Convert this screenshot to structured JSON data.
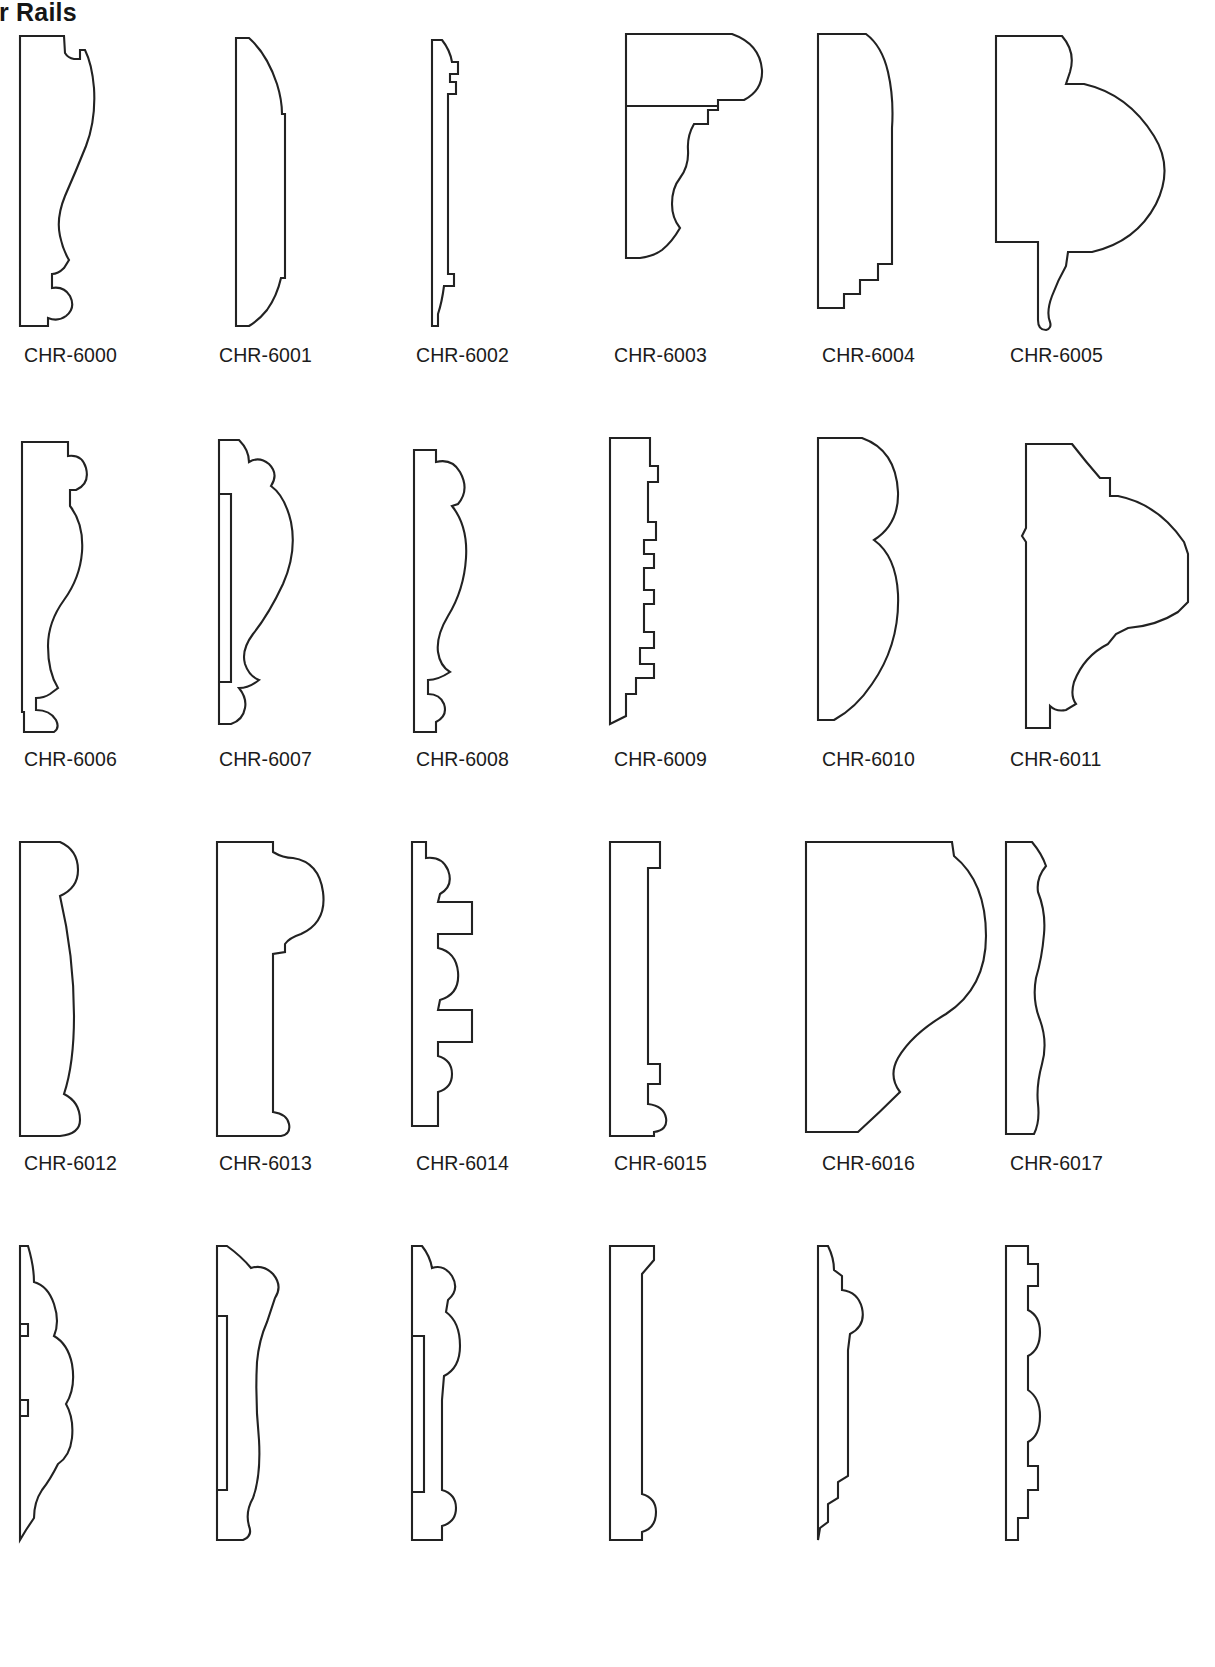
{
  "page": {
    "title": "Chair Rails",
    "title_visible_fragment": "ir Rails",
    "background_color": "#ffffff",
    "line_color": "#222222",
    "text_color": "#1b1b1b",
    "columns": 6,
    "rows_visible": 4,
    "note": "Molding profile cross-section catalog page; right column and bottom row are cropped by the page edge."
  },
  "rows": [
    {
      "index": 0,
      "items": [
        {
          "code": "CHR-6000",
          "shape": "ogee chair rail with stepped back, bead at base"
        },
        {
          "code": "CHR-6001",
          "shape": "bullnose top, flat face, cove bottom"
        },
        {
          "code": "CHR-6002",
          "shape": "narrow stepped profile with small beads"
        },
        {
          "code": "CHR-6003",
          "shape": "large quarter-round top over ogee and step"
        },
        {
          "code": "CHR-6004",
          "shape": "tall tapered face with stepped base"
        },
        {
          "code": "CHR-6005",
          "shape": "wide bullnose with ogee base (cropped)"
        }
      ]
    },
    {
      "index": 1,
      "items": [
        {
          "code": "CHR-6006",
          "shape": "bead top, long ogee face, bead base"
        },
        {
          "code": "CHR-6007",
          "shape": "double bead top, large round face, beaded base"
        },
        {
          "code": "CHR-6008",
          "shape": "bead over large ogee with stepped base"
        },
        {
          "code": "CHR-6009",
          "shape": "stepped flat with multiple reveals"
        },
        {
          "code": "CHR-6010",
          "shape": "double round wave face, flat back"
        },
        {
          "code": "CHR-6011",
          "shape": "ogee top, compound cove and bead base (cropped)"
        }
      ]
    },
    {
      "index": 2,
      "items": [
        {
          "code": "CHR-6012",
          "shape": "gentle convex face, bullnose top and bottom"
        },
        {
          "code": "CHR-6013",
          "shape": "large round bead top, stepped flat below"
        },
        {
          "code": "CHR-6014",
          "shape": "bead top, recessed flute, bead bottom"
        },
        {
          "code": "CHR-6015",
          "shape": "plain stepped flat with bead at base"
        },
        {
          "code": "CHR-6016",
          "shape": "large S-curve face with chamfered base"
        },
        {
          "code": "CHR-6017",
          "shape": "multiple wave reeds, flat back"
        }
      ]
    },
    {
      "index": 3,
      "items": [
        {
          "code": "",
          "shape": "symmetric multi-bead panel mold (cropped at page bottom)"
        },
        {
          "code": "",
          "shape": "scroll bead top with long ogee face (cropped at page bottom)"
        },
        {
          "code": "",
          "shape": "stacked bead profile (cropped at page bottom)"
        },
        {
          "code": "",
          "shape": "plain square-edge flat with bead (cropped at page bottom)"
        },
        {
          "code": "",
          "shape": "bead over stepped back band (cropped at page bottom)"
        },
        {
          "code": "",
          "shape": "multi-step reeded profile (cropped at page bottom)"
        }
      ]
    }
  ]
}
